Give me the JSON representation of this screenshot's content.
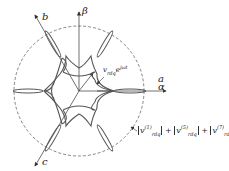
{
  "diagram": {
    "axes": {
      "alpha_top": "a",
      "alpha_bottom": "α",
      "beta": "β",
      "b": "b",
      "c": "c"
    },
    "vector_label": {
      "base": "v",
      "sub": "rdq",
      "exp": "e",
      "exp_sup": "jωt"
    },
    "circle_label": {
      "terms": [
        {
          "base": "v",
          "sup": "(1)",
          "sub": "rdq"
        },
        {
          "base": "v",
          "sup": "(5)",
          "sub": "rdq"
        },
        {
          "base": "v",
          "sup": "(7)",
          "sub": "rdq"
        }
      ],
      "op": "+"
    },
    "colors": {
      "curve": "#555555",
      "axis": "#333333",
      "dashed": "#555555"
    }
  }
}
